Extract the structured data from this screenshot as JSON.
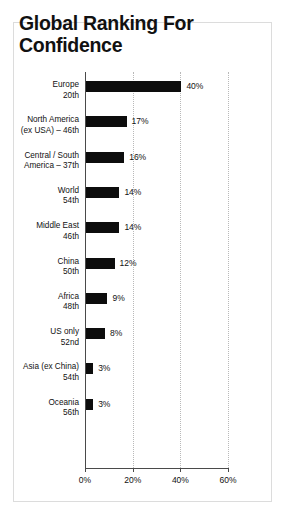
{
  "title": "Global Ranking For Confidence",
  "chart_data": {
    "type": "bar",
    "orientation": "horizontal",
    "title": "Global Ranking For Confidence",
    "xlabel": "",
    "ylabel": "",
    "xlim": [
      0,
      60
    ],
    "xticks": [
      "0%",
      "20%",
      "40%",
      "60%"
    ],
    "xtick_values": [
      0,
      20,
      40,
      60
    ],
    "grid": "vertical dotted gridlines at 20%, 40%, 60%",
    "legend": "none",
    "bar_color": "#0d0d0d",
    "categories": [
      "Europe 20th",
      "North America (ex USA) – 46th",
      "Central / South America – 37th",
      "World 54th",
      "Middle East 46th",
      "China 50th",
      "Africa 48th",
      "US only 52nd",
      "Asia (ex China) 54th",
      "Oceania 56th"
    ],
    "values": [
      40,
      17,
      16,
      14,
      14,
      12,
      9,
      8,
      3,
      3
    ],
    "data_labels": [
      "40%",
      "17%",
      "16%",
      "14%",
      "14%",
      "12%",
      "9%",
      "8%",
      "3%",
      "3%"
    ]
  },
  "rows": [
    {
      "line1": "Europe",
      "line2": "20th",
      "value": 40,
      "label": "40%"
    },
    {
      "line1": "North America",
      "line2": "(ex USA) – 46th",
      "value": 17,
      "label": "17%"
    },
    {
      "line1": "Central / South",
      "line2": "America – 37th",
      "value": 16,
      "label": "16%"
    },
    {
      "line1": "World",
      "line2": "54th",
      "value": 14,
      "label": "14%"
    },
    {
      "line1": "Middle East",
      "line2": "46th",
      "value": 14,
      "label": "14%"
    },
    {
      "line1": "China",
      "line2": "50th",
      "value": 12,
      "label": "12%"
    },
    {
      "line1": "Africa",
      "line2": "48th",
      "value": 9,
      "label": "9%"
    },
    {
      "line1": "US only",
      "line2": "52nd",
      "value": 8,
      "label": "8%"
    },
    {
      "line1": "Asia (ex China)",
      "line2": "54th",
      "value": 3,
      "label": "3%"
    },
    {
      "line1": "Oceania",
      "line2": "56th",
      "value": 3,
      "label": "3%"
    }
  ],
  "axis": {
    "ticks": [
      "0%",
      "20%",
      "40%",
      "60%"
    ]
  }
}
